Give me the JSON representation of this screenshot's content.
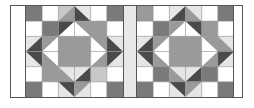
{
  "palette": {
    "white": "#ffffff",
    "light": "#e6e6e6",
    "lightmid": "#c8c8c8",
    "mid": "#9a9a9a",
    "middark": "#7a7a7a",
    "dark": "#4a4a4a",
    "grid": "#8c8c8c"
  },
  "strips": {
    "left": "#ffffff",
    "middle": "#e8e8e8",
    "right": "#ffffff"
  },
  "blocks": [
    {
      "name": "left",
      "rows": [
        [
          {
            "b": "middark"
          },
          {
            "b": "white"
          },
          {
            "b": "lightmid",
            "t": "br",
            "c": "mid"
          },
          {
            "b": "light",
            "t": "bl",
            "c": "dark"
          },
          {
            "b": "white"
          },
          {
            "b": "middark"
          }
        ],
        [
          {
            "b": "white"
          },
          {
            "b": "middark"
          },
          {
            "b": "white",
            "t": "tl",
            "c": "dark"
          },
          {
            "b": "white",
            "t": "tr",
            "c": "mid"
          },
          {
            "b": "mid"
          },
          {
            "b": "white"
          }
        ],
        [
          {
            "b": "light",
            "t": "br",
            "c": "dark"
          },
          {
            "b": "white",
            "t": "tl",
            "c": "mid"
          },
          {
            "b": "mid"
          },
          {
            "b": "mid"
          },
          {
            "b": "white",
            "t": "tr",
            "c": "mid"
          },
          {
            "b": "light",
            "t": "bl",
            "c": "dark"
          }
        ],
        [
          {
            "b": "light",
            "t": "tr",
            "c": "dark"
          },
          {
            "b": "white",
            "t": "bl",
            "c": "mid"
          },
          {
            "b": "mid"
          },
          {
            "b": "mid"
          },
          {
            "b": "white",
            "t": "br",
            "c": "mid"
          },
          {
            "b": "light",
            "t": "tl",
            "c": "dark"
          }
        ],
        [
          {
            "b": "white"
          },
          {
            "b": "mid"
          },
          {
            "b": "light",
            "t": "bl",
            "c": "mid"
          },
          {
            "b": "light",
            "t": "br",
            "c": "dark"
          },
          {
            "b": "lightmid"
          },
          {
            "b": "white"
          }
        ],
        [
          {
            "b": "middark"
          },
          {
            "b": "white"
          },
          {
            "b": "light",
            "t": "tr",
            "c": "dark"
          },
          {
            "b": "light",
            "t": "tl",
            "c": "mid"
          },
          {
            "b": "white"
          },
          {
            "b": "middark"
          }
        ]
      ]
    },
    {
      "name": "right",
      "rows": [
        [
          {
            "b": "mid"
          },
          {
            "b": "white"
          },
          {
            "b": "light",
            "t": "br",
            "c": "dark"
          },
          {
            "b": "light",
            "t": "bl",
            "c": "mid"
          },
          {
            "b": "white"
          },
          {
            "b": "middark"
          }
        ],
        [
          {
            "b": "white"
          },
          {
            "b": "middark"
          },
          {
            "b": "white",
            "t": "tl",
            "c": "mid"
          },
          {
            "b": "white",
            "t": "tr",
            "c": "dark"
          },
          {
            "b": "mid"
          },
          {
            "b": "white"
          }
        ],
        [
          {
            "b": "light",
            "t": "br",
            "c": "dark"
          },
          {
            "b": "white",
            "t": "tl",
            "c": "mid"
          },
          {
            "b": "mid"
          },
          {
            "b": "mid"
          },
          {
            "b": "white",
            "t": "tr",
            "c": "mid"
          },
          {
            "b": "light",
            "t": "bl",
            "c": "mid"
          }
        ],
        [
          {
            "b": "light",
            "t": "tr",
            "c": "dark"
          },
          {
            "b": "white",
            "t": "bl",
            "c": "mid"
          },
          {
            "b": "mid"
          },
          {
            "b": "mid"
          },
          {
            "b": "white",
            "t": "br",
            "c": "mid"
          },
          {
            "b": "light",
            "t": "tl",
            "c": "dark"
          }
        ],
        [
          {
            "b": "white"
          },
          {
            "b": "middark"
          },
          {
            "b": "light",
            "t": "bl",
            "c": "mid"
          },
          {
            "b": "light",
            "t": "br",
            "c": "dark"
          },
          {
            "b": "middark"
          },
          {
            "b": "white"
          }
        ],
        [
          {
            "b": "middark"
          },
          {
            "b": "white"
          },
          {
            "b": "light",
            "t": "tr",
            "c": "dark"
          },
          {
            "b": "light",
            "t": "tl",
            "c": "mid"
          },
          {
            "b": "white"
          },
          {
            "b": "middark"
          }
        ]
      ]
    }
  ]
}
